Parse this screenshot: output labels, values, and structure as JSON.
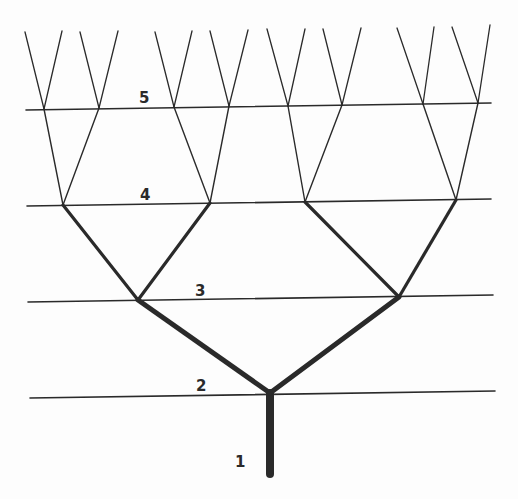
{
  "diagram": {
    "type": "binary-branching-tree",
    "line_color": "#2a2a2a",
    "background": "#fdfdfd",
    "levels": [
      {
        "label": "1",
        "label_pos": [
          235,
          455
        ],
        "line": null
      },
      {
        "label": "2",
        "label_pos": [
          196,
          379
        ],
        "line": [
          [
            30,
            398
          ],
          [
            495,
            391
          ]
        ],
        "stroke": 1.6
      },
      {
        "label": "3",
        "label_pos": [
          195,
          284
        ],
        "line": [
          [
            28,
            302
          ],
          [
            493,
            295
          ]
        ],
        "stroke": 1.6
      },
      {
        "label": "4",
        "label_pos": [
          140,
          188
        ],
        "line": [
          [
            27,
            206
          ],
          [
            491,
            199
          ]
        ],
        "stroke": 1.6
      },
      {
        "label": "5",
        "label_pos": [
          139,
          91
        ],
        "line": [
          [
            26,
            110
          ],
          [
            491,
            103
          ]
        ],
        "stroke": 1.6
      }
    ],
    "trunk": {
      "from": [
        270,
        474
      ],
      "to": [
        270,
        393
      ],
      "stroke": 8
    },
    "nodes": {
      "level2": [
        [
          270,
          393
        ]
      ],
      "level3": [
        [
          138,
          300
        ],
        [
          399,
          297
        ]
      ],
      "level4": [
        [
          63,
          205
        ],
        [
          210,
          203
        ],
        [
          305,
          202
        ],
        [
          456,
          200
        ]
      ],
      "level5": [
        [
          44,
          109
        ],
        [
          99,
          108
        ],
        [
          174,
          107
        ],
        [
          229,
          106
        ],
        [
          288,
          106
        ],
        [
          342,
          105
        ],
        [
          423,
          104
        ],
        [
          478,
          103
        ]
      ],
      "tips": [
        [
          25,
          32
        ],
        [
          62,
          31
        ],
        [
          80,
          32
        ],
        [
          118,
          31
        ],
        [
          155,
          32
        ],
        [
          192,
          31
        ],
        [
          210,
          31
        ],
        [
          248,
          30
        ],
        [
          267,
          29
        ],
        [
          305,
          29
        ],
        [
          323,
          29
        ],
        [
          361,
          28
        ],
        [
          397,
          28
        ],
        [
          434,
          27
        ],
        [
          452,
          27
        ],
        [
          490,
          25
        ]
      ]
    },
    "branch_strokes": {
      "level2_to_3": 5,
      "level3_to_4": 3.2,
      "level4_to_5": 1.4,
      "level5_to_tips": 1.3
    }
  }
}
